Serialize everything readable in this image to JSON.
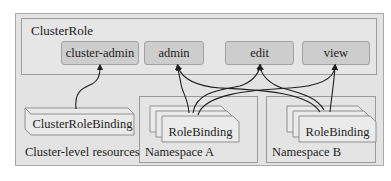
{
  "diagram": {
    "cluster_role": {
      "title": "ClusterRole",
      "roles": [
        {
          "id": "cluster-admin",
          "label": "cluster-admin"
        },
        {
          "id": "admin",
          "label": "admin"
        },
        {
          "id": "edit",
          "label": "edit"
        },
        {
          "id": "view",
          "label": "view"
        }
      ]
    },
    "cluster_level": {
      "label": "Cluster-level resources",
      "binding": "ClusterRoleBinding"
    },
    "namespaces": [
      {
        "label": "Namespace A",
        "binding": "RoleBinding"
      },
      {
        "label": "Namespace B",
        "binding": "RoleBinding"
      }
    ],
    "edges": [
      {
        "from": "ClusterRoleBinding",
        "to": "cluster-admin"
      },
      {
        "from": "Namespace A RoleBinding",
        "to": "admin"
      },
      {
        "from": "Namespace A RoleBinding",
        "to": "edit"
      },
      {
        "from": "Namespace A RoleBinding",
        "to": "view"
      },
      {
        "from": "Namespace B RoleBinding",
        "to": "admin"
      },
      {
        "from": "Namespace B RoleBinding",
        "to": "edit"
      },
      {
        "from": "Namespace B RoleBinding",
        "to": "view"
      }
    ],
    "colors": {
      "outer_bg": "#e3e3e3",
      "role_fill": "#cdcdcd",
      "card_fill": "#e9e9e9",
      "stroke": "#222222"
    }
  }
}
